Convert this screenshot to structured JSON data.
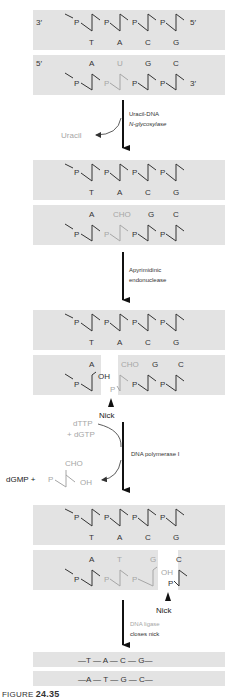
{
  "colors": {
    "band": "#e3e3e3",
    "ink": "#333333",
    "faded": "#a6a6a6"
  },
  "panel1": {
    "top_strand": {
      "end5": "5′",
      "end3": "3′",
      "bases": [
        "T",
        "A",
        "C",
        "G"
      ]
    },
    "bottom_strand": {
      "end5": "5′",
      "end3": "3′",
      "bases": [
        "A",
        "U",
        "G",
        "C"
      ]
    }
  },
  "step1": {
    "enzyme_line1": "Uracil-DNA",
    "enzyme_line2": "N-glycosylase",
    "released": "Uracil"
  },
  "panel2": {
    "top_bases": [
      "T",
      "A",
      "C",
      "G"
    ],
    "bottom_bases": [
      "A",
      "CHO",
      "G",
      "C"
    ]
  },
  "step2": {
    "enzyme_line1": "Apyrimidinic",
    "enzyme_line2": "endonuclease"
  },
  "panel3": {
    "top_bases": [
      "T",
      "A",
      "C",
      "G"
    ],
    "bottom_bases": [
      "A",
      "CHO",
      "G",
      "C"
    ],
    "oh_label": "OH",
    "p_label": "P",
    "nick_label": "Nick"
  },
  "step3": {
    "substrate_line1": "dTTP",
    "substrate_line2": "+ dGTP",
    "enzyme": "DNA polymerase I",
    "product_prefix": "dGMP + ",
    "product_p": "P",
    "product_cho": "CHO",
    "product_oh": "OH"
  },
  "panel4": {
    "top_bases": [
      "T",
      "A",
      "C",
      "G"
    ],
    "bottom_bases": [
      "A",
      "T",
      "G",
      "C"
    ],
    "oh_label": "OH",
    "p_label": "P",
    "nick_label": "Nick"
  },
  "step4": {
    "enzyme_line1": "DNA ligase",
    "enzyme_line2": "closes nick"
  },
  "final": {
    "top_line": "—T — A — C — G—",
    "bottom_line": "—A — T — G — C—"
  },
  "figure": {
    "prefix": "FIGURE ",
    "number": "24.35"
  }
}
